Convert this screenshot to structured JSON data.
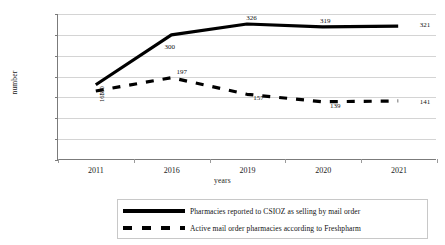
{
  "chart_data": {
    "type": "line",
    "title": "",
    "xlabel": "years",
    "ylabel": "number",
    "categories": [
      "2011",
      "2016",
      "2019",
      "2020",
      "2021"
    ],
    "ylim": [
      0,
      350
    ],
    "ytick_step": 50,
    "yticks": [
      "0",
      "50",
      "100",
      "150",
      "200",
      "250",
      "300",
      "350"
    ],
    "grid": true,
    "legend_position": "bottom",
    "series": [
      {
        "name": "Pharmacies reported to CSIOZ as selling by mail order",
        "style": "solid",
        "color": "#000000",
        "values": [
          180,
          300,
          326,
          319,
          321
        ],
        "labels": [
          "180",
          "300",
          "326",
          "319",
          "321"
        ]
      },
      {
        "name": "Active mail order pharmacies according to Freshpharm",
        "style": "dashed",
        "color": "#000000",
        "values": [
          165,
          197,
          157,
          139,
          141
        ],
        "labels": [
          "165",
          "197",
          "157",
          "139",
          "141"
        ]
      }
    ]
  }
}
